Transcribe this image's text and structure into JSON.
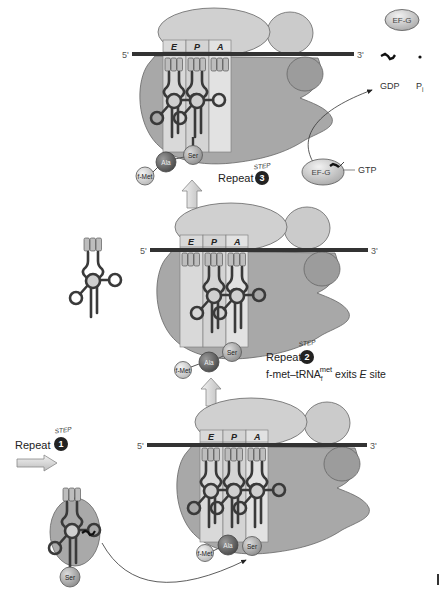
{
  "figure": {
    "type": "translation-elongation-cycle",
    "panels": {
      "top": {
        "five_prime": "5'",
        "three_prime": "3'",
        "sites": [
          "E",
          "P",
          "A"
        ],
        "amino_acids": [
          "f-Met",
          "Ala",
          "Ser"
        ],
        "step": {
          "prefix": "Repeat",
          "step_word": "STEP",
          "number": "3"
        }
      },
      "middle": {
        "five_prime": "5'",
        "three_prime": "3'",
        "sites": [
          "E",
          "P",
          "A"
        ],
        "amino_acids": [
          "f-Met",
          "Ala",
          "Ser"
        ],
        "step": {
          "prefix": "Repeat",
          "step_word": "STEP",
          "number": "2"
        },
        "note": {
          "main": "f-met–tRNA",
          "sub": "f",
          "sup": "met",
          "mid": " exits ",
          "site_italic": "E",
          "end": " site"
        }
      },
      "bottom": {
        "five_prime": "5'",
        "three_prime": "3'",
        "sites": [
          "E",
          "P",
          "A"
        ],
        "amino_acids": [
          "f-Met",
          "Ala",
          "Ser"
        ],
        "step": {
          "prefix": "Repeat",
          "step_word": "STEP",
          "number": "1"
        },
        "incoming_trna": {
          "amino_acid": "Ser"
        }
      }
    },
    "ef_g": {
      "free_label": "EF-G",
      "bound_label": "EF-G",
      "gdp": "GDP",
      "pi": "P",
      "pi_sub": "i",
      "gtp": "GTP"
    }
  },
  "colors": {
    "large_subunit": "#cbcbcb",
    "small_subunit": "#a8a8a8",
    "mrna": "#333333",
    "site_column": "#d9d9d9",
    "trna_stroke": "#3a3a3a",
    "badge": "#222222",
    "ala": "#7a7a7a",
    "fmet": "#d6d6d6",
    "ser": "#b3b3b3"
  }
}
